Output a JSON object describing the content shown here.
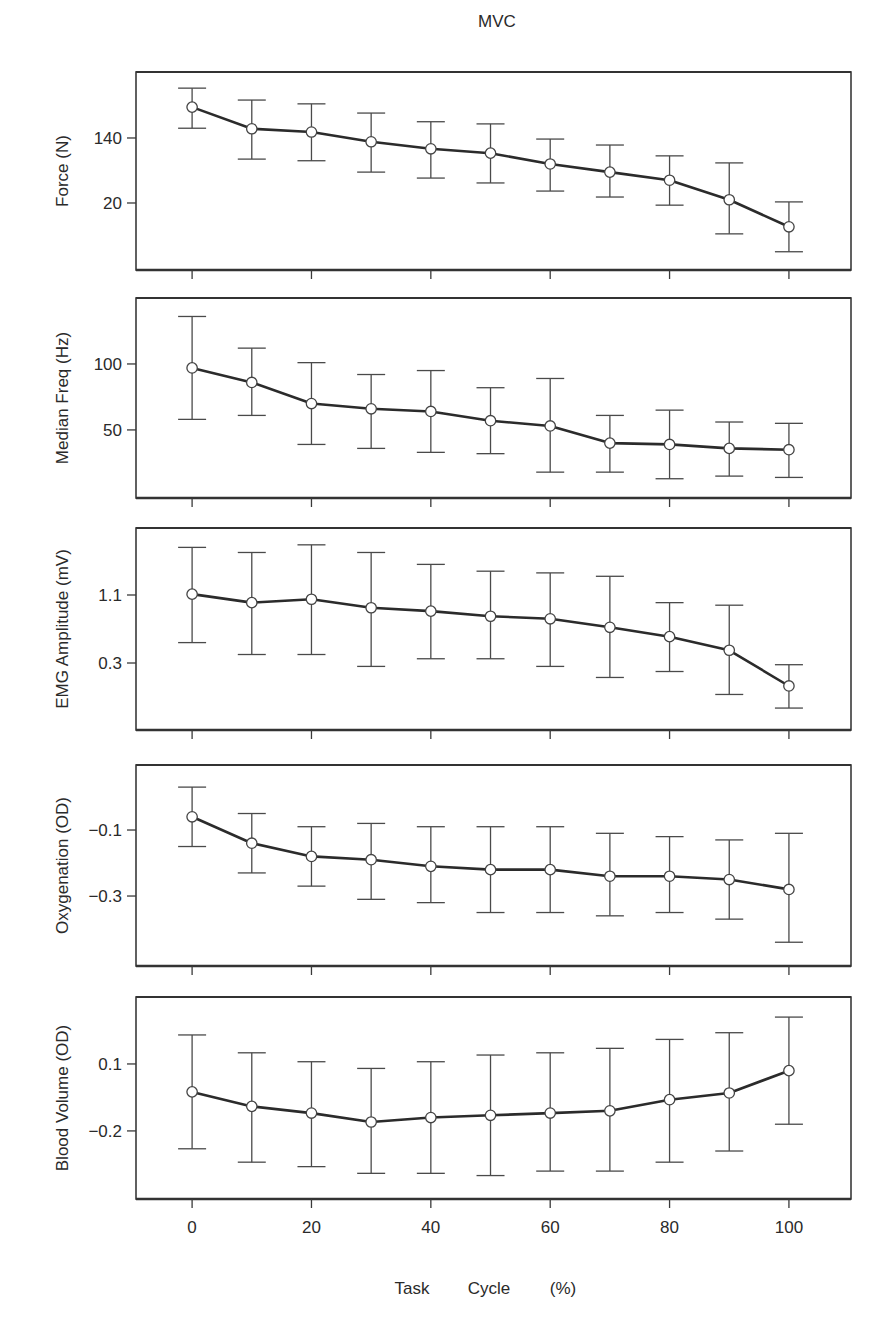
{
  "chart_data": {
    "type": "line",
    "title": "MVC",
    "xlabel_parts": [
      "Task",
      "Cycle",
      "(%)"
    ],
    "xlabel": "Task Cycle (%)",
    "x": [
      0,
      10,
      20,
      30,
      40,
      50,
      60,
      70,
      80,
      90,
      100
    ],
    "xlim": [
      -9.4,
      110.4
    ],
    "xticks": [
      0,
      20,
      40,
      60,
      80,
      100
    ],
    "xtick_labels": [
      "0",
      "20",
      "40",
      "60",
      "80",
      "100"
    ],
    "grid": false,
    "legend": "none",
    "panels": [
      {
        "name": "force",
        "ylabel": "Force (N)",
        "ylim": [
          -103.7,
          261.8
        ],
        "yticks": [
          140,
          20
        ],
        "ytick_labels": [
          "140",
          "20"
        ],
        "values": [
          197,
          157,
          151,
          133,
          120,
          112,
          92,
          77,
          62,
          26,
          -24
        ],
        "err_upper": [
          232,
          210,
          203,
          186,
          170,
          166,
          138,
          127,
          107,
          94,
          22
        ],
        "err_lower": [
          158,
          101,
          98,
          77,
          66,
          57,
          42,
          31,
          16,
          -37,
          -70
        ]
      },
      {
        "name": "median-freq",
        "ylabel": "Median Freq (Hz)",
        "ylim": [
          -1.6,
          150
        ],
        "yticks": [
          100,
          50
        ],
        "ytick_labels": [
          "100",
          "50"
        ],
        "values": [
          97,
          86,
          70,
          66,
          64,
          57,
          53,
          40,
          39,
          36,
          35
        ],
        "err_upper": [
          136,
          112,
          101,
          92,
          95,
          82,
          89,
          61,
          65,
          56,
          55
        ],
        "err_lower": [
          58,
          61,
          39,
          36,
          33,
          32,
          18,
          18,
          13,
          15,
          14
        ]
      },
      {
        "name": "emg-amplitude",
        "ylabel": "EMG Amplitude (mV)",
        "ylim": [
          -0.488,
          1.888
        ],
        "yticks": [
          1.1,
          0.3
        ],
        "ytick_labels": [
          "1.1",
          "0.3"
        ],
        "values": [
          1.11,
          1.01,
          1.05,
          0.95,
          0.91,
          0.85,
          0.82,
          0.72,
          0.61,
          0.45,
          0.03
        ],
        "err_upper": [
          1.66,
          1.6,
          1.69,
          1.6,
          1.46,
          1.38,
          1.36,
          1.32,
          1.01,
          0.98,
          0.28
        ],
        "err_lower": [
          0.54,
          0.4,
          0.4,
          0.26,
          0.35,
          0.35,
          0.26,
          0.13,
          0.2,
          -0.07,
          -0.23
        ]
      },
      {
        "name": "oxygenation",
        "ylabel": "Oxygenation (OD)",
        "ylim": [
          -0.512,
          0.097
        ],
        "yticks": [
          -0.1,
          -0.3
        ],
        "ytick_labels": [
          "−0.1",
          "−0.3"
        ],
        "values": [
          -0.06,
          -0.14,
          -0.18,
          -0.19,
          -0.21,
          -0.22,
          -0.22,
          -0.24,
          -0.24,
          -0.25,
          -0.28
        ],
        "err_upper": [
          0.03,
          -0.05,
          -0.09,
          -0.08,
          -0.09,
          -0.09,
          -0.09,
          -0.11,
          -0.12,
          -0.13,
          -0.11
        ],
        "err_lower": [
          -0.15,
          -0.23,
          -0.27,
          -0.31,
          -0.32,
          -0.35,
          -0.35,
          -0.36,
          -0.35,
          -0.37,
          -0.44
        ]
      },
      {
        "name": "blood-volume",
        "ylabel": "Blood Volume (OD)",
        "ylim": [
          -0.505,
          0.4
        ],
        "yticks": [
          0.1,
          -0.2
        ],
        "ytick_labels": [
          "0.1",
          "−0.2"
        ],
        "values": [
          -0.025,
          -0.09,
          -0.12,
          -0.16,
          -0.14,
          -0.13,
          -0.12,
          -0.11,
          -0.06,
          -0.03,
          0.07
        ],
        "err_upper": [
          0.23,
          0.15,
          0.11,
          0.08,
          0.11,
          0.14,
          0.15,
          0.17,
          0.21,
          0.24,
          0.31
        ],
        "err_lower": [
          -0.28,
          -0.34,
          -0.36,
          -0.39,
          -0.39,
          -0.4,
          -0.38,
          -0.38,
          -0.34,
          -0.29,
          -0.17
        ]
      }
    ]
  }
}
